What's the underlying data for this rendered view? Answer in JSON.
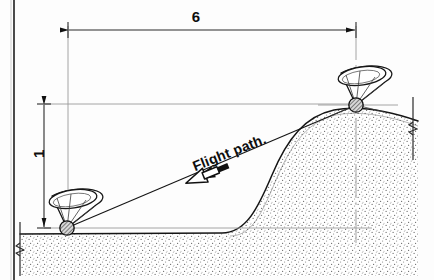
{
  "figure": {
    "type": "technical-line-drawing",
    "background_color": "#fdfdfd",
    "ink_color": "#111111"
  },
  "labels": {
    "horizontal_dimension": "6",
    "vertical_dimension": "1",
    "flight_path": "Flight path."
  },
  "dimensions": {
    "horizontal": {
      "value": "6",
      "orientation": "horizontal",
      "arrow_style": "double-ended",
      "from_x": 68,
      "to_x": 356,
      "line_y": 30
    },
    "vertical": {
      "value": "1",
      "orientation": "vertical",
      "arrow_style": "double-ended",
      "from_y": 104,
      "to_y": 227,
      "line_x": 44,
      "text_rotation_deg": -90
    }
  },
  "stations": [
    {
      "name": "ground-station-left",
      "cx": 67,
      "cy": 228,
      "elevation": "base",
      "marker": "hatched-circle",
      "beam": "cone"
    },
    {
      "name": "ground-station-right",
      "cx": 356,
      "cy": 105,
      "elevation": "hilltop",
      "marker": "hatched-circle",
      "beam": "cone"
    }
  ],
  "flight_path": {
    "label": "Flight path.",
    "direction_arrow": "down-left",
    "rotation_deg": -21.5,
    "start": {
      "x": 67,
      "y": 228
    },
    "end": {
      "x": 356,
      "y": 105
    }
  },
  "terrain": {
    "fill_style": "stipple",
    "left_ground_level_y": 234,
    "hill_crest_y": 110,
    "break_symbols": 2
  },
  "colors": {
    "ink": "#111111",
    "construction_line": "#8c8c8c",
    "dimension_line": "#4a4a4a",
    "stipple": "#5a5a5a",
    "page_border": "#1a1a1a"
  }
}
